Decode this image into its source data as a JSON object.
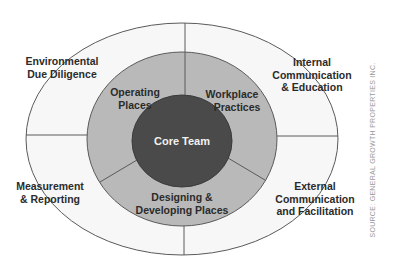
{
  "diagram": {
    "colors": {
      "outer_ring": "#f7f7f7",
      "middle_ring": "#b9b9b9",
      "core": "#4a4a4a",
      "stroke": "#5a5a5a",
      "label_text": "#2b2b2b",
      "core_text": "#f2f2f2",
      "source_text": "#9a9a9a"
    },
    "core": {
      "label": "Core Team"
    },
    "middle_ring": [
      {
        "line1": "Operating",
        "line2": "Places"
      },
      {
        "line1": "Workplace",
        "line2": "Practices"
      },
      {
        "line1": "Designing &",
        "line2": "Developing Places"
      }
    ],
    "outer_ring": [
      {
        "line1": "Environmental",
        "line2": "Due Diligence"
      },
      {
        "line1": "Internal",
        "line2": "Communication",
        "line3": "& Education"
      },
      {
        "line1": "Measurement",
        "line2": "& Reporting"
      },
      {
        "line1": "External",
        "line2": "Communication",
        "line3": "and Facilitation"
      }
    ],
    "source": "SOURCE: GENERAL GROWTH PROPERTIES INC."
  }
}
